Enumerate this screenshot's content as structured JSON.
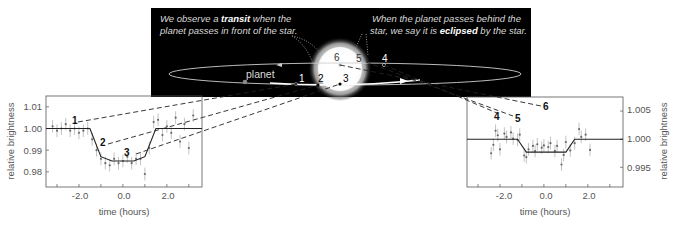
{
  "caption": {
    "transit_line1_pre": "We observe a ",
    "transit_line1_bold": "transit",
    "transit_line1_post": " when the",
    "transit_line2": "planet passes in front of the star.",
    "eclipse_line1": "When the planet passes behind the",
    "eclipse_line2_pre": "star, we say it is ",
    "eclipse_line2_bold": "eclipsed",
    "eclipse_line2_post": " by the star."
  },
  "orbit": {
    "planet_label": "planet",
    "star_label": "star",
    "positions": [
      "1",
      "2",
      "3",
      "4",
      "5",
      "6"
    ]
  },
  "colors": {
    "panel_bg": "#000000",
    "orbit": "#cfcfcf",
    "star_core": "#ffffff",
    "caption_text": "#d9d9d9",
    "plot_line": "#222222",
    "data_points": "#8a8a8a",
    "axis_text": "#666666"
  },
  "chart_data": [
    {
      "type": "scatter",
      "title": "Transit light curve",
      "xlabel": "time (hours)",
      "ylabel": "relative brightness",
      "xlim": [
        -3.5,
        3.6
      ],
      "ylim": [
        0.973,
        1.015
      ],
      "xticks": [
        "-2.0",
        "0.0",
        "2.0"
      ],
      "yticks": [
        "1.01",
        "1.00",
        "0.99",
        "0.98"
      ],
      "annotations": [
        "1",
        "2",
        "3"
      ],
      "model": {
        "x": [
          -3.5,
          -1.5,
          -1.0,
          -0.5,
          0.0,
          0.5,
          1.0,
          1.5,
          3.6
        ],
        "y": [
          1.0,
          1.0,
          0.987,
          0.985,
          0.985,
          0.985,
          0.987,
          1.0,
          1.0
        ]
      },
      "points": {
        "x": [
          -3.2,
          -3.0,
          -2.8,
          -2.6,
          -2.4,
          -2.2,
          -2.0,
          -1.8,
          -1.6,
          -1.4,
          -1.2,
          -1.0,
          -0.8,
          -0.6,
          -0.4,
          -0.2,
          0.0,
          0.2,
          0.4,
          0.6,
          0.8,
          1.0,
          1.2,
          1.4,
          1.6,
          1.8,
          2.0,
          2.2,
          2.4,
          2.6,
          2.8,
          3.0,
          3.2
        ],
        "y": [
          1.001,
          0.999,
          1.0,
          1.002,
          0.999,
          1.0,
          0.998,
          0.999,
          1.0,
          0.995,
          0.99,
          0.986,
          0.984,
          0.983,
          0.986,
          0.984,
          0.985,
          0.987,
          0.984,
          0.986,
          0.986,
          0.979,
          0.991,
          1.003,
          1.004,
          0.997,
          1.001,
          0.998,
          1.005,
          0.994,
          1.002,
          0.991,
          1.006
        ]
      }
    },
    {
      "type": "scatter",
      "title": "Secondary eclipse light curve",
      "xlabel": "time (hours)",
      "ylabel": "relative brightness",
      "xlim": [
        -3.5,
        3.6
      ],
      "ylim": [
        0.9915,
        1.0075
      ],
      "xticks": [
        "-2.0",
        "0.0",
        "2.0"
      ],
      "yticks": [
        "1.005",
        "1.000",
        "0.995"
      ],
      "annotations": [
        "4",
        "5",
        "6"
      ],
      "model": {
        "x": [
          -3.5,
          -1.2,
          -0.8,
          1.0,
          1.4,
          3.6
        ],
        "y": [
          1.0,
          1.0,
          0.9977,
          0.9977,
          1.0,
          1.0
        ]
      },
      "points": {
        "x": [
          -2.4,
          -2.3,
          -2.2,
          -2.1,
          -2.0,
          -1.8,
          -1.7,
          -1.5,
          -1.4,
          -1.2,
          -1.1,
          -0.9,
          -0.8,
          -0.7,
          -0.5,
          -0.4,
          -0.3,
          -0.1,
          0.0,
          0.2,
          0.3,
          0.5,
          0.6,
          0.8,
          0.9,
          1.0,
          1.2,
          1.4,
          1.6,
          1.7,
          1.9,
          2.1
        ],
        "y": [
          0.9975,
          0.999,
          1.0015,
          1.0007,
          0.9982,
          1.001,
          1.0004,
          1.0012,
          1.0001,
          0.9999,
          1.0008,
          0.9971,
          0.9968,
          0.9982,
          0.9988,
          0.9979,
          0.9991,
          0.9985,
          0.9989,
          0.9986,
          0.9993,
          0.9979,
          0.9988,
          0.9955,
          0.9972,
          0.9995,
          0.998,
          0.9993,
          1.0018,
          1.0004,
          1.0008,
          0.9981
        ]
      }
    }
  ]
}
